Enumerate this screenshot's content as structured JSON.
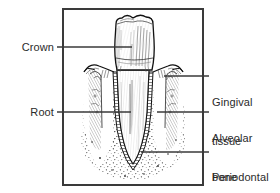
{
  "figure": {
    "frame": {
      "x": 62,
      "y": 8,
      "width": 142,
      "height": 178,
      "stroke": "#3a3a3a",
      "stroke_width": 2,
      "fill": "#ffffff"
    },
    "background_color": "#ffffff",
    "ink_color": "#1a1a1a",
    "label_color": "#2b2b2b"
  },
  "labels": {
    "crown": {
      "text": "Crown",
      "side": "left",
      "leader": {
        "x1": 57,
        "y1": 47,
        "x2": 132,
        "y2": 47
      }
    },
    "root": {
      "text": "Root",
      "side": "left",
      "leader": {
        "x1": 57,
        "y1": 112,
        "x2": 131,
        "y2": 112
      }
    },
    "gingival_tissue": {
      "line1": "Gingival",
      "line2": "tissue",
      "side": "right",
      "leader": {
        "x1": 164,
        "y1": 76,
        "x2": 209,
        "y2": 76
      }
    },
    "alveolar_bone": {
      "line1": "Alveolar",
      "line2": "bone",
      "side": "right",
      "leader": {
        "x1": 157,
        "y1": 112,
        "x2": 209,
        "y2": 112
      }
    },
    "periodontal_ligament": {
      "line1": "Periodontal",
      "line2": "ligament",
      "side": "right",
      "leader": {
        "x1": 141,
        "y1": 152,
        "x2": 209,
        "y2": 152
      }
    }
  },
  "structures": {
    "crown_enamel": "crown-enamel-region",
    "root_dentin": "root-dentin-region",
    "gingiva_left": "gingival-tissue-left",
    "gingiva_right": "gingival-tissue-right",
    "alveolar_bone_left": "alveolar-bone-left",
    "alveolar_bone_right": "alveolar-bone-right",
    "pdl_band": "periodontal-ligament-band",
    "cancellous_stipple": "cancellous-bone-stipple"
  }
}
